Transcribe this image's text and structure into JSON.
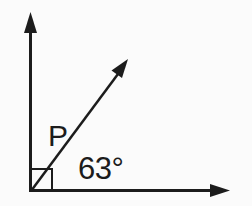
{
  "diagram": {
    "labels": {
      "point": "P",
      "angle": "63°"
    },
    "angle_degrees": 63,
    "right_angle_marker_between": "vertical-ray and horizontal-ray",
    "colors": {
      "ink": "#1c1c1c",
      "background": "#fbfbfb"
    }
  }
}
